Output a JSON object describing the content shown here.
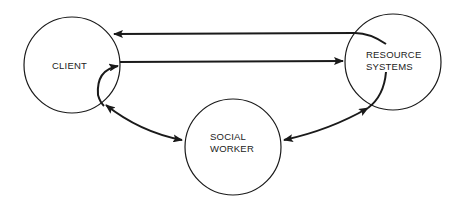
{
  "diagram": {
    "nodes": [
      {
        "id": "client",
        "label_lines": [
          "CLIENT"
        ]
      },
      {
        "id": "resource_systems",
        "label_lines": [
          "RESOURCE",
          "SYSTEMS"
        ]
      },
      {
        "id": "social_worker",
        "label_lines": [
          "SOCIAL",
          "WORKER"
        ]
      }
    ],
    "edges": [
      {
        "from": "resource_systems",
        "to": "client",
        "type": "directed"
      },
      {
        "from": "client",
        "to": "resource_systems",
        "type": "directed"
      },
      {
        "from": "client",
        "to": "social_worker",
        "type": "bidirectional"
      },
      {
        "from": "social_worker",
        "to": "resource_systems",
        "type": "bidirectional"
      }
    ],
    "colors": {
      "line": "#1a1a1a",
      "background": "#ffffff"
    }
  }
}
